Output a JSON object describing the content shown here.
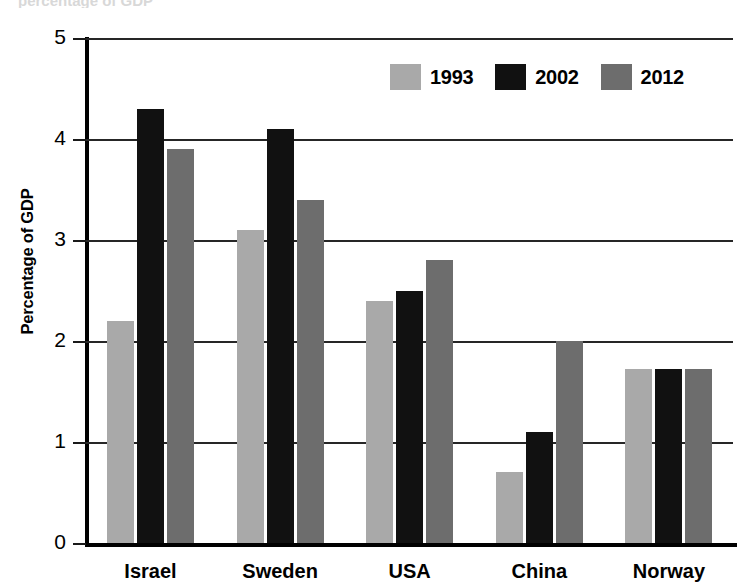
{
  "clipped_header_text": "percentage of GDP",
  "chart_data": {
    "type": "bar",
    "title": "",
    "xlabel": "",
    "ylabel": "Percentage of GDP",
    "ylim": [
      0,
      5
    ],
    "yticks": [
      "0",
      "1",
      "2",
      "3",
      "4",
      "5"
    ],
    "grid": true,
    "legend_position": "top-right",
    "categories": [
      "Israel",
      "Sweden",
      "USA",
      "China",
      "Norway"
    ],
    "series": [
      {
        "name": "1993",
        "color": "#a9a9a9",
        "values": [
          2.2,
          3.1,
          2.4,
          0.7,
          1.72
        ]
      },
      {
        "name": "2002",
        "color": "#111111",
        "values": [
          4.3,
          4.1,
          2.5,
          1.1,
          1.72
        ]
      },
      {
        "name": "2012",
        "color": "#6d6d6d",
        "values": [
          3.9,
          3.4,
          2.8,
          2.0,
          1.72
        ]
      }
    ]
  }
}
